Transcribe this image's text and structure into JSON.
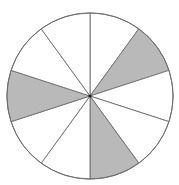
{
  "diagram": {
    "type": "fraction-circle",
    "total_slices": 10,
    "shaded_slices": [
      1,
      4,
      7
    ],
    "shaded_count": 3,
    "colors": {
      "shaded": "#b9b9b9",
      "unshaded": "#ffffff",
      "stroke": "#6e6e6e"
    }
  }
}
